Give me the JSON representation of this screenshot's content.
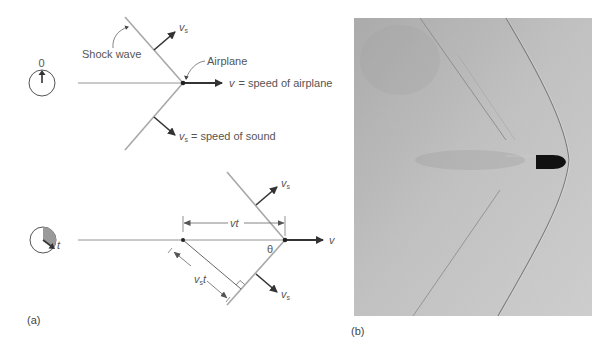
{
  "figure": {
    "panel_a": {
      "label": "(a)",
      "top_diagram": {
        "clock_label": "0",
        "shock_wave_label": "Shock wave",
        "airplane_label": "Airplane",
        "v_symbol": "v",
        "v_description": "= speed of airplane",
        "vs_symbol": "v",
        "vs_subscript": "s",
        "vs_description": "= speed of sound"
      },
      "bottom_diagram": {
        "clock_label": "t",
        "vt_label_v": "v",
        "vt_label_t": "t",
        "theta_label": "θ",
        "vs_t_symbol": "v",
        "vs_t_subscript": "s",
        "vs_t_t": "t",
        "v_symbol": "v",
        "vs_symbol": "v",
        "vs_subscript": "s"
      }
    },
    "panel_b": {
      "label": "(b)",
      "description": "photograph of bullet producing conical shock wave"
    },
    "colors": {
      "shock_line": "#a8a8a8",
      "arrow": "#333333",
      "thin_line": "#777777",
      "photo_bg": "#bdbdbd",
      "bullet": "#111111",
      "clock_shade": "#9a9a9a"
    }
  }
}
